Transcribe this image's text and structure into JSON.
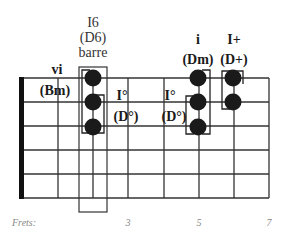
{
  "diagram": {
    "title_lines": [
      "I6",
      "(D6)",
      "barre"
    ],
    "frets_label": "Frets:",
    "fret_numbers": [
      {
        "label": "3",
        "fret_index": 3
      },
      {
        "label": "5",
        "fret_index": 5
      },
      {
        "label": "7",
        "fret_index": 7
      }
    ],
    "grid": {
      "strings": 6,
      "frets_shown": 7,
      "nut": true,
      "line_color": "#333333",
      "nut_color": "#111111"
    },
    "chords": [
      {
        "id": "vi",
        "numeral": "vi",
        "name": "(Bm)",
        "bold": true,
        "dots": []
      },
      {
        "id": "I6",
        "numeral": "I6",
        "name": "(D6)",
        "note": "barre",
        "bold": false,
        "fret_index": 2,
        "dots": [
          0,
          1,
          2
        ],
        "barre_box": true
      },
      {
        "id": "Idim-1",
        "numeral": "I°",
        "name": "(D°)",
        "bold": true,
        "dots": []
      },
      {
        "id": "Idim-2",
        "numeral": "I°",
        "name": "(D°)",
        "bold": true,
        "dots": []
      },
      {
        "id": "i",
        "numeral": "i",
        "name": "(Dm)",
        "bold": true,
        "fret_index": 5,
        "dots": [
          0,
          1,
          2
        ]
      },
      {
        "id": "Iaug",
        "numeral": "I+",
        "name": "(D+)",
        "bold": true,
        "fret_index": 6,
        "dots": [
          0,
          1
        ]
      }
    ],
    "dot_color": "#1a1a1a"
  }
}
